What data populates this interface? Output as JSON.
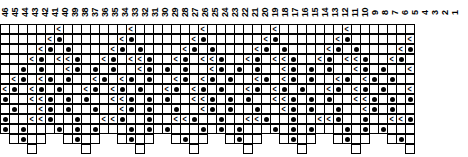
{
  "chart_data": {
    "type": "table",
    "xlabel": "",
    "ylabel": "",
    "grid": true,
    "legend_position": "none",
    "columns": 46,
    "rows": 13,
    "cell_size_px": 10,
    "symbol_legend": {
      "dot": "yarn-over",
      "dec": "decrease",
      "blank": "knit",
      "none": "no-stitch"
    },
    "column_numbers": [
      "46",
      "45",
      "44",
      "43",
      "42",
      "41",
      "40",
      "39",
      "38",
      "37",
      "36",
      "35",
      "34",
      "33",
      "32",
      "31",
      "30",
      "29",
      "28",
      "27",
      "26",
      "25",
      "24",
      "23",
      "22",
      "21",
      "20",
      "19",
      "18",
      "17",
      "16",
      "15",
      "14",
      "13",
      "12",
      "11",
      "10",
      "9",
      "8",
      "7",
      "6",
      "5",
      "4",
      "3",
      "2",
      "1"
    ],
    "row_numbers": [
      "13",
      "12",
      "11",
      "10",
      "9",
      "8",
      "7",
      "6",
      "5",
      "4",
      "3",
      "2",
      "1"
    ],
    "cells": [
      [
        "b",
        "b",
        "b",
        "b",
        "b",
        "b",
        "<",
        "b",
        "b",
        "b",
        "b",
        "b",
        "b",
        "b",
        "<",
        "b",
        "b",
        "b",
        "b",
        "b",
        "b",
        "b",
        "<",
        "b",
        "b",
        "b",
        "b",
        "b",
        "b",
        "b",
        "<",
        "b",
        "b",
        "b",
        "b",
        "b",
        "b",
        "b",
        "<",
        "b",
        "b",
        "b",
        "b",
        "b",
        "b",
        "b"
      ],
      [
        "b",
        "b",
        "b",
        "b",
        "b",
        "<",
        "o",
        "b",
        "b",
        "b",
        "b",
        "b",
        "b",
        "<",
        "o",
        "b",
        "b",
        "b",
        "b",
        "b",
        "b",
        "<",
        "o",
        "b",
        "b",
        "b",
        "b",
        "b",
        "b",
        "<",
        "o",
        "b",
        "b",
        "b",
        "b",
        "b",
        "b",
        "<",
        "o",
        "b",
        "b",
        "b",
        "b",
        "b",
        "b",
        "<"
      ],
      [
        "b",
        "b",
        "b",
        "b",
        "<",
        "o",
        "b",
        "o",
        "b",
        "b",
        "b",
        "b",
        "<",
        "o",
        "b",
        "o",
        "b",
        "b",
        "b",
        "b",
        "<",
        "o",
        "b",
        "o",
        "b",
        "b",
        "b",
        "b",
        "<",
        "o",
        "b",
        "o",
        "b",
        "b",
        "b",
        "b",
        "<",
        "o",
        "b",
        "o",
        "b",
        "b",
        "b",
        "b",
        "<",
        "o"
      ],
      [
        "b",
        "b",
        "b",
        "<",
        "o",
        "b",
        "<",
        "<",
        "o",
        "b",
        "b",
        "<",
        "o",
        "b",
        "<",
        "<",
        "o",
        "b",
        "b",
        "<",
        "o",
        "b",
        "<",
        "<",
        "o",
        "b",
        "b",
        "<",
        "o",
        "b",
        "<",
        "<",
        "o",
        "b",
        "b",
        "<",
        "o",
        "b",
        "<",
        "<",
        "o",
        "b",
        "b",
        "<",
        "o",
        "b"
      ],
      [
        "b",
        "b",
        "o",
        "b",
        "o",
        "b",
        "b",
        "<",
        "o",
        "b",
        "o",
        "b",
        "o",
        "b",
        "b",
        "<",
        "o",
        "b",
        "o",
        "b",
        "o",
        "b",
        "b",
        "<",
        "o",
        "b",
        "o",
        "b",
        "o",
        "b",
        "b",
        "<",
        "o",
        "b",
        "o",
        "b",
        "o",
        "b",
        "b",
        "<",
        "o",
        "b",
        "o",
        "b",
        "b",
        "<"
      ],
      [
        "b",
        "<",
        "o",
        "b",
        "<",
        "o",
        "b",
        "o",
        "b",
        "b",
        "<",
        "o",
        "b",
        "<",
        "o",
        "b",
        "o",
        "b",
        "b",
        "<",
        "o",
        "b",
        "<",
        "o",
        "b",
        "o",
        "b",
        "b",
        "<",
        "o",
        "b",
        "<",
        "o",
        "b",
        "o",
        "b",
        "b",
        "<",
        "o",
        "b",
        "<",
        "o",
        "b",
        "o",
        "b",
        "b"
      ],
      [
        "<",
        "o",
        "b",
        "<",
        "o",
        "b",
        "o",
        "b",
        "b",
        "<",
        "o",
        "b",
        "<",
        "o",
        "b",
        "o",
        "b",
        "b",
        "<",
        "o",
        "b",
        "<",
        "o",
        "b",
        "o",
        "b",
        "b",
        "<",
        "o",
        "b",
        "<",
        "o",
        "b",
        "o",
        "b",
        "b",
        "<",
        "o",
        "b",
        "<",
        "o",
        "b",
        "o",
        "b",
        "b",
        "<"
      ],
      [
        "o",
        "b",
        "b",
        "<",
        "<",
        "o",
        "b",
        "o",
        "b",
        "o",
        "b",
        "b",
        "<",
        "<",
        "o",
        "b",
        "o",
        "b",
        "o",
        "b",
        "b",
        "<",
        "<",
        "o",
        "b",
        "o",
        "b",
        "o",
        "b",
        "b",
        "<",
        "<",
        "o",
        "b",
        "o",
        "b",
        "o",
        "b",
        "b",
        "<",
        "<",
        "o",
        "b",
        "o",
        "b",
        "o"
      ],
      [
        "b",
        "o",
        "b",
        "b",
        "<",
        "o",
        "b",
        "o",
        "b",
        "b",
        "o",
        "b",
        "b",
        "<",
        "o",
        "b",
        "o",
        "b",
        "b",
        "o",
        "b",
        "b",
        "<",
        "o",
        "b",
        "o",
        "b",
        "b",
        "o",
        "b",
        "b",
        "<",
        "o",
        "b",
        "o",
        "b",
        "b",
        "o",
        "b",
        "b",
        "<",
        "o",
        "b",
        "o",
        "b",
        "b"
      ],
      [
        "o",
        "b",
        "b",
        "<",
        "<",
        "o",
        "b",
        "b",
        "o",
        "b",
        "b",
        "<",
        "<",
        "o",
        "b",
        "b",
        "o",
        "b",
        "b",
        "<",
        "<",
        "o",
        "b",
        "b",
        "o",
        "b",
        "b",
        "<",
        "<",
        "o",
        "b",
        "b",
        "o",
        "b",
        "b",
        "<",
        "<",
        "o",
        "b",
        "b",
        "o",
        "b",
        "b",
        "<",
        "<",
        "o"
      ],
      [
        "o",
        "b",
        "o",
        "b",
        "b",
        "b",
        "o",
        "b",
        "o",
        "b",
        "o",
        "b",
        "b",
        "b",
        "o",
        "b",
        "o",
        "b",
        "o",
        "b",
        "b",
        "b",
        "o",
        "b",
        "o",
        "b",
        "o",
        "b",
        "b",
        "b",
        "o",
        "b",
        "o",
        "b",
        "o",
        "b",
        "b",
        "b",
        "o",
        "b",
        "o",
        "b",
        "o",
        "b",
        "b",
        "b"
      ],
      [
        "n",
        "b",
        "o",
        "b",
        "b",
        "n",
        "n",
        "b",
        "o",
        "b",
        "b",
        "n",
        "n",
        "b",
        "o",
        "b",
        "b",
        "n",
        "n",
        "b",
        "o",
        "b",
        "b",
        "n",
        "n",
        "b",
        "o",
        "b",
        "b",
        "n",
        "n",
        "b",
        "o",
        "b",
        "b",
        "n",
        "n",
        "b",
        "o",
        "b",
        "b",
        "n",
        "n",
        "b",
        "o",
        "b"
      ],
      [
        "n",
        "n",
        "n",
        "b",
        "n",
        "n",
        "n",
        "n",
        "n",
        "b",
        "n",
        "n",
        "n",
        "n",
        "n",
        "b",
        "n",
        "n",
        "n",
        "n",
        "n",
        "b",
        "n",
        "n",
        "n",
        "n",
        "n",
        "b",
        "n",
        "n",
        "n",
        "n",
        "n",
        "b",
        "n",
        "n",
        "n",
        "n",
        "n",
        "b",
        "n",
        "n",
        "n",
        "n",
        "n",
        "b"
      ]
    ]
  }
}
